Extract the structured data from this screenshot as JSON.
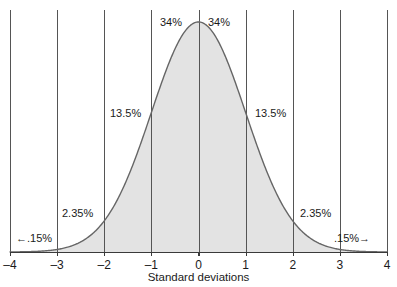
{
  "chart_data": {
    "type": "area",
    "title": "",
    "subtitle": "",
    "xlabel": "Standard deviations",
    "ylabel": "",
    "xlim": [
      -4,
      4
    ],
    "ylim": [
      0,
      0.4
    ],
    "grid": "vertical gridlines at every integer standard deviation",
    "legend": "none",
    "curve": "standard normal probability density, mean 0, standard deviation 1",
    "x_ticks": [
      "–4",
      "–3",
      "–2",
      "–1",
      "0",
      "1",
      "2",
      "3",
      "4"
    ],
    "x_tick_values": [
      -4,
      -3,
      -2,
      -1,
      0,
      1,
      2,
      3,
      4
    ],
    "y_ticks": [],
    "x": [
      -4,
      -3.75,
      -3.5,
      -3.25,
      -3,
      -2.75,
      -2.5,
      -2.25,
      -2,
      -1.75,
      -1.5,
      -1.25,
      -1,
      -0.75,
      -0.5,
      -0.25,
      0,
      0.25,
      0.5,
      0.75,
      1,
      1.25,
      1.5,
      1.75,
      2,
      2.25,
      2.5,
      2.75,
      3,
      3.25,
      3.5,
      3.75,
      4
    ],
    "y": [
      0.0001,
      0.0004,
      0.0009,
      0.002,
      0.0044,
      0.0091,
      0.0175,
      0.0317,
      0.054,
      0.0863,
      0.1295,
      0.1826,
      0.242,
      0.3011,
      0.3521,
      0.3867,
      0.3989,
      0.3867,
      0.3521,
      0.3011,
      0.242,
      0.1826,
      0.1295,
      0.0863,
      0.054,
      0.0317,
      0.0175,
      0.0091,
      0.0044,
      0.002,
      0.0009,
      0.0004,
      0.0001
    ],
    "bands": [
      {
        "name": "below-minus-3",
        "range": [
          -4,
          -3
        ],
        "percent": ".15%",
        "label": "←.15%"
      },
      {
        "name": "minus-3-to-minus-2",
        "range": [
          -3,
          -2
        ],
        "percent": "2.35%",
        "label": "2.35%"
      },
      {
        "name": "minus-2-to-minus-1",
        "range": [
          -2,
          -1
        ],
        "percent": "13.5%",
        "label": "13.5%"
      },
      {
        "name": "minus-1-to-0",
        "range": [
          -1,
          0
        ],
        "percent": "34%",
        "label": "34%"
      },
      {
        "name": "0-to-1",
        "range": [
          0,
          1
        ],
        "percent": "34%",
        "label": "34%"
      },
      {
        "name": "1-to-2",
        "range": [
          1,
          2
        ],
        "percent": "13.5%",
        "label": "13.5%"
      },
      {
        "name": "2-to-3",
        "range": [
          2,
          3
        ],
        "percent": "2.35%",
        "label": "2.35%"
      },
      {
        "name": "above-3",
        "range": [
          3,
          4
        ],
        "percent": ".15%",
        "label": ".15%→"
      }
    ],
    "colors": {
      "area_fill": "#e3e3e3",
      "curve_stroke": "#666666",
      "gridline": "#555555",
      "axis_line": "#3a3a3a",
      "text": "#1a1a1a",
      "background": "#ffffff"
    }
  },
  "labels": {
    "pct_34_left": "34%",
    "pct_34_right": "34%",
    "pct_135_left": "13.5%",
    "pct_135_right": "13.5%",
    "pct_235_left": "2.35%",
    "pct_235_right": "2.35%",
    "pct_015_left": "←.15%",
    "pct_015_right": ".15%→"
  },
  "axis": {
    "title": "Standard deviations",
    "ticks": [
      "–4",
      "–3",
      "–2",
      "–1",
      "0",
      "1",
      "2",
      "3",
      "4"
    ]
  }
}
